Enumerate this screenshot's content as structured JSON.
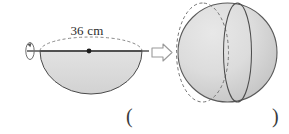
{
  "figure": {
    "dimension_label": "36 cm",
    "transform_arrow": "double-right-arrow",
    "rotation_indicator": "rotation-arrow",
    "left_shape": {
      "name": "hemisphere",
      "diameter_cm": 36,
      "has_dashed_top_arc": true,
      "has_center_dot": true,
      "has_axis_line": true
    },
    "right_shape": {
      "name": "sphere",
      "has_dashed_meridian": true,
      "has_solid_meridian": true
    },
    "colors": {
      "fill": "#d9d9d9",
      "outline": "#4a4a4a",
      "dashed": "#6a6a6a",
      "text": "#2b2b2b",
      "arrow_outline": "#8a8a8a"
    }
  },
  "answer": {
    "open_paren": "(",
    "close_paren": ")",
    "value": ""
  }
}
